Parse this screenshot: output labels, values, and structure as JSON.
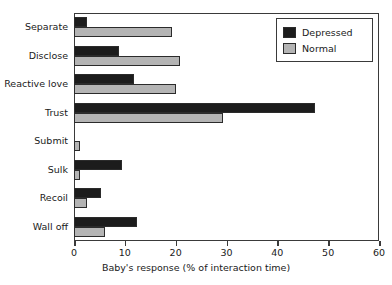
{
  "chart_data": {
    "type": "bar",
    "orientation": "horizontal",
    "title": "",
    "xlabel": "Baby's response (% of interaction time)",
    "ylabel": "",
    "xlim": [
      0,
      60
    ],
    "xticks": [
      0,
      10,
      20,
      30,
      40,
      50,
      60
    ],
    "xtick_labels": [
      "0",
      "10",
      "20",
      "30",
      "40",
      "50",
      "60"
    ],
    "grid": false,
    "legend_position": "top-right",
    "categories": [
      "Separate",
      "Disclose",
      "Reactive love",
      "Trust",
      "Submit",
      "Sulk",
      "Recoil",
      "Wall off"
    ],
    "series": [
      {
        "name": "Depressed",
        "color": "#1c1c1c",
        "values": [
          2.5,
          8.8,
          11.8,
          47.4,
          0.0,
          9.4,
          5.3,
          12.4
        ]
      },
      {
        "name": "Normal",
        "color": "#b4b4b4",
        "values": [
          19.2,
          20.8,
          20.0,
          29.3,
          1.1,
          1.1,
          2.5,
          6.0
        ]
      }
    ]
  },
  "legend": {
    "items": [
      {
        "label": "Depressed",
        "swatch": "depressed"
      },
      {
        "label": "Normal",
        "swatch": "normal"
      }
    ]
  },
  "axis": {
    "x_title": "Baby's response (% of interaction time)"
  }
}
